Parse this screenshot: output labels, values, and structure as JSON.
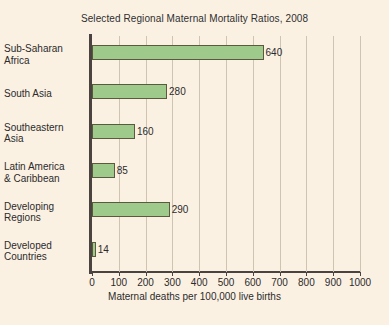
{
  "chart_data": {
    "type": "bar",
    "orientation": "horizontal",
    "title": "Selected Regional Maternal Mortality Ratios, 2008",
    "xlabel": "Maternal deaths per 100,000 live births",
    "ylabel": "",
    "xlim": [
      0,
      1000
    ],
    "xticks": [
      0,
      100,
      200,
      300,
      400,
      500,
      600,
      700,
      800,
      900,
      1000
    ],
    "xtick_labels": [
      "0",
      "100",
      "200",
      "300",
      "400",
      "500",
      "600",
      "700",
      "800",
      "900",
      "1000"
    ],
    "grid": true,
    "grid_axis": "x",
    "legend": false,
    "categories": [
      "Sub-Saharan Africa",
      "South Asia",
      "Southeastern Asia",
      "Latin America & Caribbean",
      "Developing Regions",
      "Developed Countries"
    ],
    "category_lines": [
      [
        "Sub-Saharan",
        "Africa"
      ],
      [
        "South Asia"
      ],
      [
        "Southeastern",
        "Asia"
      ],
      [
        "Latin America",
        "& Caribbean"
      ],
      [
        "Developing",
        "Regions"
      ],
      [
        "Developed",
        "Countries"
      ]
    ],
    "values": [
      640,
      280,
      160,
      85,
      290,
      14
    ],
    "value_labels": [
      "640",
      "280",
      "160",
      "85",
      "290",
      "14"
    ],
    "bar_color": "#9ecb8c",
    "bar_border_color": "#5c5a3e",
    "background_color": "#fbf1e3",
    "grid_color": "#cfc3b2",
    "axis_color": "#4a4340",
    "text_color": "#2b2b2b"
  }
}
